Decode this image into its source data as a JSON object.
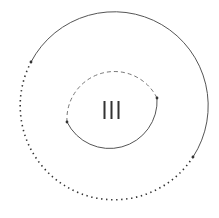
{
  "diagram": {
    "center_label": "III",
    "colors": {
      "stroke": "#444444",
      "dot": "#333333",
      "text": "#333333"
    },
    "outer_circle": {
      "cx": 111.5,
      "cy": 110.5,
      "r": 94,
      "solid_arc": {
        "start_deg": 211,
        "end_deg": 30
      },
      "dotted_arc": {
        "start_deg": 30,
        "end_deg": 211
      },
      "endpoints": [
        [
          31,
          62
        ],
        [
          193,
          157
        ]
      ]
    },
    "inner_circle": {
      "cx": 111.5,
      "cy": 110,
      "r": 47.5,
      "dashed_arc": {
        "start_deg": 165,
        "end_deg": 345
      },
      "solid_arc": {
        "start_deg": 345,
        "end_deg": 165
      },
      "endpoints": [
        [
          67,
          122
        ],
        [
          157,
          98
        ]
      ]
    }
  }
}
